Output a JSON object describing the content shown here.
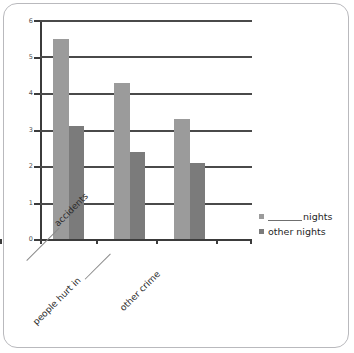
{
  "chart_data": {
    "type": "bar",
    "title": "",
    "xlabel": "",
    "ylabel": "",
    "ylim": [
      0,
      6
    ],
    "yticks": [
      "0",
      "1",
      "2",
      "3",
      "4",
      "5",
      "6"
    ],
    "grid": true,
    "legend_position": "right",
    "categories": [
      "______ accidents",
      "people hurt in ______",
      "other crime"
    ],
    "category_parts": [
      {
        "blank_before": true,
        "text": "accidents",
        "blank_after": false
      },
      {
        "blank_before": false,
        "text": "people hurt in",
        "blank_after": true
      },
      {
        "blank_before": false,
        "text": "other crime",
        "blank_after": false
      }
    ],
    "series": [
      {
        "name": "______ nights",
        "label_blank_before": true,
        "label_text": "nights",
        "color": "#9b9b9b",
        "values": [
          5.5,
          4.3,
          3.3
        ]
      },
      {
        "name": "other nights",
        "label_blank_before": false,
        "label_text": "other nights",
        "color": "#7b7b7b",
        "values": [
          3.1,
          2.4,
          2.1
        ]
      }
    ]
  },
  "axis": {
    "y_labels": [
      "6",
      "5",
      "4",
      "3",
      "2",
      "1",
      "0"
    ]
  },
  "legend": {
    "items": [
      {
        "label": "nights",
        "color": "#9b9b9b",
        "has_blank": true
      },
      {
        "label": "other nights",
        "color": "#7b7b7b",
        "has_blank": false
      }
    ]
  },
  "colors": {
    "series_light": "#9b9b9b",
    "series_dark": "#7b7b7b",
    "axis": "#3b3b3b",
    "grid": "#4a4a4a",
    "frame": "#b9b9bd",
    "text": "#2b2b2b"
  }
}
